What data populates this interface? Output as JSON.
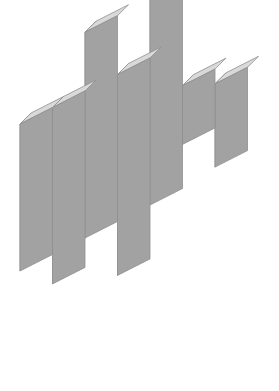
{
  "figure": {
    "background_color": "#ffffff",
    "width": 279,
    "height": 391
  },
  "projection": {
    "type": "sheared-isometric",
    "column_width": 32.5,
    "column_shear_dy": -16.5,
    "row_height": 49,
    "depth_dx": 11,
    "depth_dy": -11,
    "origin_x": 20,
    "origin_y": 222
  },
  "materials": {
    "front_face_color": "#a2a2a2",
    "top_face_color": "#d9d9d9",
    "side_face_color": "#b3b3b3",
    "edge_color": "#8f8f8f",
    "grid_line_color": "#ffffff",
    "grid_line_dash": "4 4",
    "grid_line_width": 1.6
  },
  "columns": [
    {
      "name": "column-1",
      "index": 0,
      "top_level": 2.0,
      "bottom_level": -1.0
    },
    {
      "name": "column-2",
      "index": 1,
      "top_level": 2.0,
      "bottom_level": -1.6
    },
    {
      "name": "column-3",
      "index": 2,
      "top_level": 3.2,
      "bottom_level": -1.0
    },
    {
      "name": "column-4",
      "index": 3,
      "top_level": 2.0,
      "bottom_level": -2.1
    },
    {
      "name": "column-5",
      "index": 4,
      "top_level": 3.9,
      "bottom_level": -1.0
    },
    {
      "name": "column-6",
      "index": 5,
      "top_level": 1.1,
      "bottom_level": -0.1
    },
    {
      "name": "column-7",
      "index": 6,
      "top_level": 0.8,
      "bottom_level": -0.9
    }
  ],
  "grid_lines": {
    "vertical_count": 6,
    "horizontal_count": 4,
    "style": "dashed-white"
  },
  "labels": {
    "caption": ""
  }
}
